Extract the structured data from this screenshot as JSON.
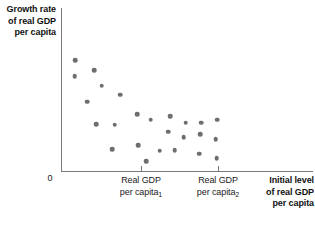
{
  "chart_data": {
    "type": "scatter",
    "title": "",
    "ylabel": "Growth rate\nof real GDP\nper capita",
    "xlabel": "Initial level\nof real GDP\nper capita",
    "origin_label": "0",
    "grid": false,
    "legend": null,
    "axis_color": "#7a7a7a",
    "point_color": "#6e6e6e",
    "text_color": "#111111",
    "xlim": [
      0,
      1
    ],
    "ylim": [
      0,
      1
    ],
    "xticks": [
      {
        "pixel_x": 141,
        "label_line1": "Real GDP",
        "label_line2": "per capita",
        "subscript": "1"
      },
      {
        "pixel_x": 218,
        "label_line1": "Real GDP",
        "label_line2": "per capita",
        "subscript": "2"
      }
    ],
    "annotation": "Scatter of country growth rates against initial real GDP per capita; growth declines as initial income rises, then flattens.",
    "points": [
      {
        "x": 75,
        "y": 60.3
      },
      {
        "x": 74.7,
        "y": 76.0
      },
      {
        "x": 94.3,
        "y": 70.3
      },
      {
        "x": 101.7,
        "y": 85.7
      },
      {
        "x": 120.0,
        "y": 94.7
      },
      {
        "x": 87.3,
        "y": 101.7
      },
      {
        "x": 137.3,
        "y": 114.0
      },
      {
        "x": 150.7,
        "y": 119.7
      },
      {
        "x": 170.0,
        "y": 116.0
      },
      {
        "x": 96.0,
        "y": 124.3
      },
      {
        "x": 114.7,
        "y": 124.7
      },
      {
        "x": 185.7,
        "y": 122.7
      },
      {
        "x": 201.0,
        "y": 122.7
      },
      {
        "x": 217.3,
        "y": 119.7
      },
      {
        "x": 168.0,
        "y": 131.7
      },
      {
        "x": 183.7,
        "y": 137.3
      },
      {
        "x": 200.0,
        "y": 134.0
      },
      {
        "x": 215.7,
        "y": 139.3
      },
      {
        "x": 112.0,
        "y": 149.0
      },
      {
        "x": 138.0,
        "y": 145.0
      },
      {
        "x": 159.7,
        "y": 150.7
      },
      {
        "x": 174.7,
        "y": 150.0
      },
      {
        "x": 199.0,
        "y": 153.7
      },
      {
        "x": 216.7,
        "y": 158.3
      },
      {
        "x": 146.3,
        "y": 161.0
      }
    ]
  },
  "labels": {
    "y_axis_line1": "Growth rate",
    "y_axis_line2": "of real GDP",
    "y_axis_line3": "per capita",
    "x_axis_line1": "Initial level",
    "x_axis_line2": "of real GDP",
    "x_axis_line3": "per capita",
    "origin": "0",
    "tick1_line1": "Real GDP",
    "tick1_line2": "per capita",
    "tick1_sub": "1",
    "tick2_line1": "Real GDP",
    "tick2_line2": "per capita",
    "tick2_sub": "2"
  }
}
